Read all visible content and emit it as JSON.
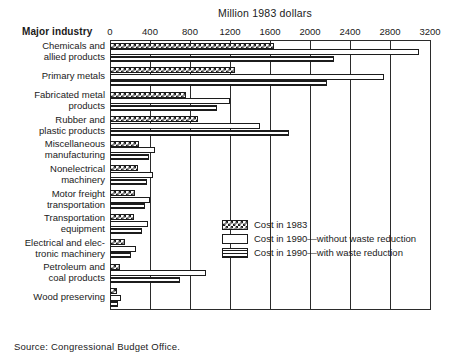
{
  "chart_data": {
    "type": "bar",
    "orientation": "horizontal",
    "title": "Million 1983 dollars",
    "xlabel": "Million 1983 dollars",
    "ylabel": "Major industry",
    "category_header": "Major industry",
    "grid": true,
    "xlim": [
      0,
      3200
    ],
    "xticks": [
      0,
      400,
      800,
      1200,
      1600,
      2000,
      2400,
      2800,
      3200
    ],
    "xtick_labels": [
      "0",
      "400",
      "800",
      "1200",
      "1600",
      "2000",
      "2400",
      "2800",
      "3200"
    ],
    "legend_position": "inner-right",
    "categories": [
      "Chemicals and allied products",
      "Primary metals",
      "Fabricated metal products",
      "Rubber and plastic products",
      "Miscellaneous manufacturing",
      "Nonelectrical machinery",
      "Motor freight transportation",
      "Transportation equipment",
      "Electrical and electronic machinery",
      "Petroleum and coal products",
      "Wood preserving"
    ],
    "category_lines": [
      [
        "Chemicals and",
        "allied products"
      ],
      [
        "Primary metals"
      ],
      [
        "Fabricated metal",
        "products"
      ],
      [
        "Rubber and",
        "plastic products"
      ],
      [
        "Miscellaneous",
        "manufacturing"
      ],
      [
        "Nonelectrical",
        "machinery"
      ],
      [
        "Motor freight",
        "transportation"
      ],
      [
        "Transportation",
        "equipment"
      ],
      [
        "Electrical and elec-",
        "tronic machinery"
      ],
      [
        "Petroleum and",
        "coal products"
      ],
      [
        "Wood preserving"
      ]
    ],
    "series": [
      {
        "name": "Cost in 1983",
        "pattern": "dark-crosshatch",
        "values": [
          1640,
          1250,
          755,
          880,
          285,
          275,
          250,
          235,
          150,
          95,
          65
        ]
      },
      {
        "name": "Cost in 1990—without waste reduction",
        "pattern": "white",
        "values": [
          3090,
          2740,
          1200,
          1500,
          450,
          430,
          400,
          380,
          255,
          960,
          105
        ]
      },
      {
        "name": "Cost in 1990—with waste reduction",
        "pattern": "horizontal-lines",
        "values": [
          2240,
          2170,
          1070,
          1790,
          390,
          370,
          345,
          320,
          205,
          700,
          80
        ]
      }
    ],
    "legend_entries": [
      "Cost in 1983",
      "Cost in 1990—without waste reduction",
      "Cost in 1990—with waste reduction"
    ],
    "source": "Source: Congressional Budget Office."
  }
}
